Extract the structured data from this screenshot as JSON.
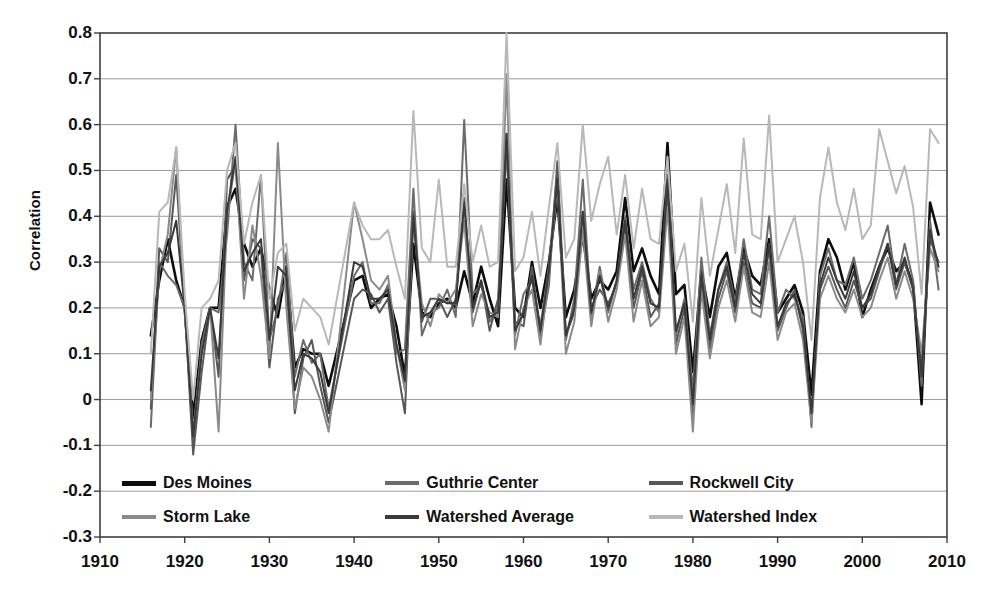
{
  "chart_data": {
    "type": "line",
    "title": "",
    "xlabel": "",
    "ylabel": "Correlation",
    "xlim": [
      1910,
      2010
    ],
    "ylim": [
      -0.3,
      0.8
    ],
    "grid": true,
    "legend_position": "inside-bottom",
    "xticks": [
      "1910",
      "1920",
      "1930",
      "1940",
      "1950",
      "1960",
      "1970",
      "1980",
      "1990",
      "2000",
      "2010"
    ],
    "yticks": [
      "0.8",
      "0.7",
      "0.6",
      "0.5",
      "0.4",
      "0.3",
      "0.2",
      "0.1",
      "0",
      "-0.1",
      "-0.2",
      "-0.3"
    ],
    "x": [
      1916,
      1917,
      1918,
      1919,
      1920,
      1921,
      1922,
      1923,
      1924,
      1925,
      1926,
      1927,
      1928,
      1929,
      1930,
      1931,
      1932,
      1933,
      1934,
      1935,
      1936,
      1937,
      1940,
      1941,
      1942,
      1943,
      1944,
      1945,
      1946,
      1947,
      1948,
      1949,
      1950,
      1951,
      1952,
      1953,
      1954,
      1955,
      1956,
      1957,
      1958,
      1959,
      1960,
      1961,
      1962,
      1963,
      1964,
      1965,
      1966,
      1967,
      1968,
      1969,
      1970,
      1971,
      1972,
      1973,
      1974,
      1975,
      1976,
      1977,
      1978,
      1979,
      1980,
      1981,
      1982,
      1983,
      1984,
      1985,
      1986,
      1987,
      1988,
      1989,
      1990,
      1991,
      1992,
      1993,
      1994,
      1995,
      1996,
      1997,
      1998,
      1999,
      2000,
      2001,
      2002,
      2003,
      2004,
      2005,
      2006,
      2007,
      2008,
      2009
    ],
    "series": [
      {
        "name": "Des Moines",
        "color": "#0d0d0d",
        "width": 2.6,
        "values": [
          0.14,
          0.26,
          0.35,
          0.26,
          0.2,
          -0.04,
          0.13,
          0.2,
          0.2,
          0.42,
          0.46,
          0.34,
          0.29,
          0.33,
          0.24,
          0.18,
          0.29,
          0.07,
          0.11,
          0.1,
          0.1,
          0.03,
          0.26,
          0.27,
          0.2,
          0.22,
          0.23,
          0.16,
          0.05,
          0.34,
          0.19,
          0.18,
          0.21,
          0.22,
          0.2,
          0.28,
          0.21,
          0.29,
          0.22,
          0.16,
          0.48,
          0.2,
          0.18,
          0.3,
          0.2,
          0.3,
          0.44,
          0.18,
          0.24,
          0.36,
          0.22,
          0.26,
          0.24,
          0.28,
          0.44,
          0.28,
          0.33,
          0.27,
          0.23,
          0.56,
          0.23,
          0.25,
          0.06,
          0.28,
          0.18,
          0.29,
          0.32,
          0.22,
          0.33,
          0.27,
          0.25,
          0.35,
          0.19,
          0.22,
          0.25,
          0.19,
          0.01,
          0.28,
          0.35,
          0.31,
          0.24,
          0.3,
          0.18,
          0.24,
          0.29,
          0.33,
          0.28,
          0.3,
          0.25,
          -0.01,
          0.43,
          0.36
        ]
      },
      {
        "name": "Guthrie Center",
        "color": "#6b6b6b",
        "width": 2.0,
        "values": [
          -0.06,
          0.3,
          0.27,
          0.25,
          0.2,
          -0.09,
          0.12,
          0.2,
          0.19,
          0.36,
          0.6,
          0.3,
          0.26,
          0.49,
          0.13,
          0.2,
          0.32,
          0.05,
          0.13,
          0.08,
          0.1,
          -0.02,
          0.27,
          0.3,
          0.21,
          0.21,
          0.25,
          0.1,
          0.11,
          0.46,
          0.14,
          0.19,
          0.2,
          0.24,
          0.18,
          0.61,
          0.23,
          0.25,
          0.17,
          0.2,
          0.55,
          0.14,
          0.23,
          0.26,
          0.16,
          0.29,
          0.5,
          0.13,
          0.22,
          0.48,
          0.18,
          0.29,
          0.19,
          0.26,
          0.4,
          0.24,
          0.3,
          0.22,
          0.19,
          0.49,
          0.14,
          0.22,
          0.02,
          0.31,
          0.14,
          0.24,
          0.3,
          0.21,
          0.35,
          0.24,
          0.23,
          0.4,
          0.19,
          0.24,
          0.22,
          0.18,
          -0.06,
          0.27,
          0.33,
          0.26,
          0.25,
          0.31,
          0.22,
          0.26,
          0.32,
          0.38,
          0.25,
          0.34,
          0.26,
          0.03,
          0.39,
          0.24
        ]
      },
      {
        "name": "Rockwell City",
        "color": "#585858",
        "width": 2.0,
        "values": [
          -0.02,
          0.33,
          0.3,
          0.49,
          0.2,
          -0.12,
          0.06,
          0.2,
          0.05,
          0.48,
          0.51,
          0.26,
          0.35,
          0.33,
          0.07,
          0.22,
          0.26,
          -0.03,
          0.09,
          0.13,
          0.03,
          -0.05,
          0.22,
          0.24,
          0.23,
          0.19,
          0.22,
          0.08,
          -0.03,
          0.41,
          0.17,
          0.22,
          0.22,
          0.18,
          0.22,
          0.44,
          0.19,
          0.26,
          0.15,
          0.22,
          0.58,
          0.17,
          0.16,
          0.29,
          0.14,
          0.25,
          0.52,
          0.14,
          0.19,
          0.41,
          0.2,
          0.24,
          0.21,
          0.25,
          0.38,
          0.2,
          0.28,
          0.18,
          0.21,
          0.46,
          0.12,
          0.2,
          -0.04,
          0.27,
          0.11,
          0.22,
          0.28,
          0.19,
          0.3,
          0.21,
          0.2,
          0.33,
          0.15,
          0.2,
          0.24,
          0.15,
          -0.03,
          0.24,
          0.29,
          0.24,
          0.2,
          0.26,
          0.2,
          0.22,
          0.28,
          0.34,
          0.24,
          0.3,
          0.24,
          0.07,
          0.35,
          0.3
        ]
      },
      {
        "name": "Storm Lake",
        "color": "#8a8a8a",
        "width": 2.0,
        "values": [
          0.0,
          0.28,
          0.36,
          0.55,
          0.19,
          -0.07,
          0.1,
          0.2,
          -0.07,
          0.4,
          0.52,
          0.22,
          0.38,
          0.27,
          0.09,
          0.56,
          0.2,
          -0.02,
          0.07,
          0.05,
          0.0,
          -0.07,
          0.43,
          0.35,
          0.26,
          0.24,
          0.27,
          0.12,
          0.02,
          0.39,
          0.21,
          0.16,
          0.23,
          0.21,
          0.24,
          0.39,
          0.16,
          0.23,
          0.19,
          0.18,
          0.71,
          0.11,
          0.2,
          0.24,
          0.12,
          0.27,
          0.47,
          0.1,
          0.17,
          0.37,
          0.16,
          0.28,
          0.17,
          0.24,
          0.36,
          0.17,
          0.26,
          0.16,
          0.18,
          0.42,
          0.1,
          0.18,
          -0.07,
          0.24,
          0.09,
          0.2,
          0.26,
          0.17,
          0.29,
          0.19,
          0.18,
          0.3,
          0.13,
          0.19,
          0.21,
          0.13,
          -0.05,
          0.22,
          0.27,
          0.22,
          0.19,
          0.24,
          0.18,
          0.2,
          0.26,
          0.31,
          0.22,
          0.28,
          0.22,
          0.1,
          0.33,
          0.28
        ]
      },
      {
        "name": "Watershed Average",
        "color": "#3a3a3a",
        "width": 2.0,
        "values": [
          0.02,
          0.29,
          0.32,
          0.39,
          0.2,
          -0.08,
          0.1,
          0.2,
          0.09,
          0.41,
          0.53,
          0.28,
          0.32,
          0.35,
          0.13,
          0.29,
          0.27,
          0.02,
          0.1,
          0.09,
          0.06,
          -0.03,
          0.3,
          0.29,
          0.22,
          0.22,
          0.24,
          0.12,
          0.04,
          0.4,
          0.18,
          0.19,
          0.22,
          0.21,
          0.21,
          0.43,
          0.2,
          0.26,
          0.18,
          0.19,
          0.58,
          0.15,
          0.19,
          0.27,
          0.15,
          0.28,
          0.48,
          0.14,
          0.2,
          0.41,
          0.19,
          0.27,
          0.2,
          0.26,
          0.39,
          0.22,
          0.29,
          0.21,
          0.2,
          0.48,
          0.15,
          0.21,
          -0.01,
          0.27,
          0.13,
          0.24,
          0.29,
          0.2,
          0.32,
          0.23,
          0.21,
          0.34,
          0.16,
          0.21,
          0.23,
          0.16,
          -0.03,
          0.25,
          0.31,
          0.26,
          0.22,
          0.28,
          0.2,
          0.23,
          0.29,
          0.34,
          0.25,
          0.31,
          0.24,
          0.05,
          0.37,
          0.29
        ]
      },
      {
        "name": "Watershed Index",
        "color": "#b8b8b8",
        "width": 2.0,
        "values": [
          0.1,
          0.41,
          0.43,
          0.55,
          0.23,
          0.0,
          0.2,
          0.22,
          0.26,
          0.5,
          0.56,
          0.34,
          0.43,
          0.49,
          0.22,
          0.32,
          0.34,
          0.15,
          0.22,
          0.2,
          0.18,
          0.12,
          0.43,
          0.38,
          0.35,
          0.35,
          0.37,
          0.29,
          0.22,
          0.63,
          0.33,
          0.3,
          0.48,
          0.29,
          0.29,
          0.47,
          0.3,
          0.38,
          0.29,
          0.3,
          0.8,
          0.28,
          0.31,
          0.41,
          0.27,
          0.42,
          0.56,
          0.31,
          0.35,
          0.6,
          0.39,
          0.47,
          0.53,
          0.36,
          0.49,
          0.33,
          0.46,
          0.35,
          0.34,
          0.53,
          0.28,
          0.34,
          0.17,
          0.44,
          0.27,
          0.37,
          0.47,
          0.32,
          0.57,
          0.36,
          0.35,
          0.62,
          0.3,
          0.35,
          0.4,
          0.3,
          0.13,
          0.44,
          0.55,
          0.43,
          0.37,
          0.46,
          0.35,
          0.38,
          0.59,
          0.52,
          0.45,
          0.51,
          0.42,
          0.23,
          0.59,
          0.56
        ]
      }
    ]
  },
  "legend": {
    "items": [
      {
        "label": "Des Moines",
        "color": "#0d0d0d"
      },
      {
        "label": "Guthrie Center",
        "color": "#6b6b6b"
      },
      {
        "label": "Rockwell City",
        "color": "#585858"
      },
      {
        "label": "Storm Lake",
        "color": "#8a8a8a"
      },
      {
        "label": "Watershed Average",
        "color": "#3a3a3a"
      },
      {
        "label": "Watershed Index",
        "color": "#b8b8b8"
      }
    ]
  },
  "style": {
    "background": "#ffffff",
    "axis_color": "#3f3f3f",
    "grid_color": "#9a9a9a",
    "text_color": "#111111"
  }
}
